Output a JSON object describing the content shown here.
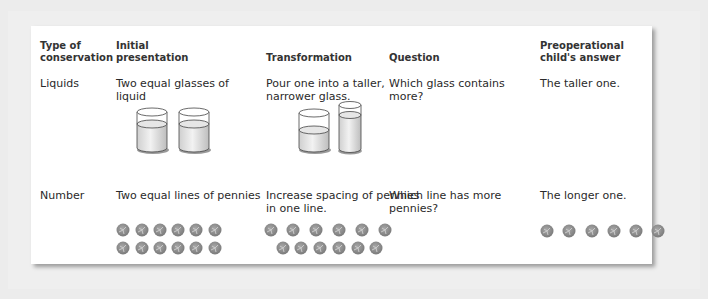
{
  "table": {
    "headers": {
      "type": [
        "Type of",
        "conservation"
      ],
      "initial": [
        "Initial",
        "presentation"
      ],
      "transformation": [
        "Transformation"
      ],
      "question": [
        "Question"
      ],
      "answer": [
        "Preoperational",
        "child's answer"
      ]
    },
    "rows": [
      {
        "type": "Liquids",
        "initial": [
          "Two equal glasses of",
          "liquid"
        ],
        "transformation": [
          "Pour one into a taller,",
          "narrower glass."
        ],
        "question": [
          "Which glass contains",
          "more?"
        ],
        "answer": [
          "The taller one."
        ],
        "illustrations": {
          "initial": "two-equal-glasses",
          "transformation": "short-glass-and-tall-glass"
        }
      },
      {
        "type": "Number",
        "initial": [
          "Two equal lines of pennies"
        ],
        "transformation": [
          "Increase spacing of pennies",
          "in one line."
        ],
        "question": [
          "Which line has more",
          "pennies?"
        ],
        "answer": [
          "The longer one."
        ],
        "illustrations": {
          "initial": "two-rows-of-6-pennies",
          "transformation": "spread-row-and-compact-row-of-6-pennies",
          "answer": "one-spread-row-of-6-pennies"
        }
      }
    ]
  },
  "colors": {
    "background": "#ececec",
    "card": "#ffffff",
    "text": "#2a2a2a",
    "penny": "#8a8a8a",
    "liquid": "#d8d8d8"
  }
}
